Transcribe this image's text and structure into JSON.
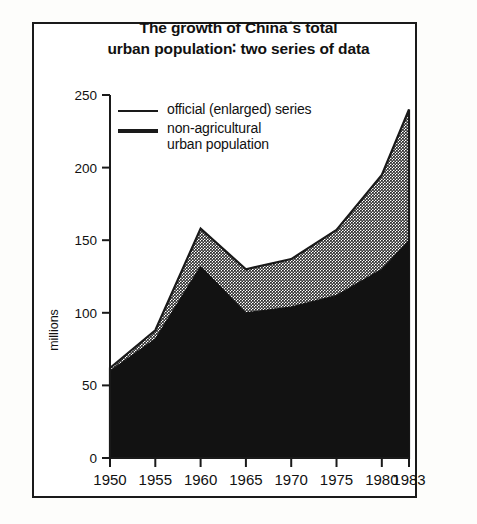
{
  "figure": {
    "title_line1": "The growth of China´s total",
    "title_line2": "urban population∶ two series of data",
    "border_color": "#1a1a1a",
    "background": "#ffffff"
  },
  "legend": {
    "position": "inside-top-left",
    "entries": [
      {
        "label": "official (enlarged) series",
        "swatch": "thin-line",
        "color": "#9a9a9a"
      },
      {
        "label": "non-agricultural\nurban population",
        "swatch": "thick-line",
        "color": "#1a1a1a"
      }
    ]
  },
  "axes": {
    "ylabel": "millions",
    "yticks": [
      "0",
      "50",
      "100",
      "150",
      "200",
      "250"
    ],
    "xticks": [
      "1950",
      "1955",
      "1960",
      "1965",
      "1970",
      "1975",
      "1980",
      "1983"
    ]
  },
  "chart_data": {
    "type": "area",
    "title": "The growth of China´s total urban population∶ two series of data",
    "xlabel": "",
    "ylabel": "millions",
    "xlim": [
      1950,
      1983
    ],
    "ylim": [
      0,
      250
    ],
    "grid": false,
    "legend_position": "upper left inside",
    "stacked": false,
    "x": [
      1950,
      1955,
      1960,
      1965,
      1970,
      1975,
      1980,
      1983
    ],
    "series": [
      {
        "name": "official (enlarged) series",
        "fill": "#9a9a9a",
        "values": [
          62,
          88,
          158,
          130,
          137,
          157,
          195,
          240
        ]
      },
      {
        "name": "non-agricultural urban population",
        "fill": "#121212",
        "values": [
          60,
          82,
          132,
          100,
          104,
          112,
          130,
          150
        ]
      }
    ]
  }
}
